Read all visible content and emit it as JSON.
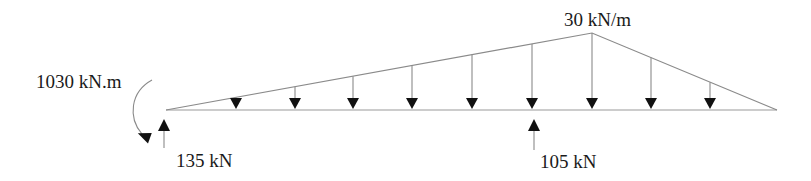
{
  "diagram": {
    "type": "beam-free-body-diagram",
    "load": {
      "label": "30 kN/m",
      "shape": "triangular",
      "peak_value": "30 kN/m",
      "arrow_count": 9
    },
    "moment": {
      "label": "1030 kN.m",
      "direction": "clockwise"
    },
    "reactions": [
      {
        "label": "135 kN",
        "direction": "up",
        "position": "left-end"
      },
      {
        "label": "105 kN",
        "direction": "up",
        "position": "interior"
      }
    ],
    "colors": {
      "line": "#8a8a8a",
      "arrowhead": "#111111",
      "text": "#1a1a1a"
    }
  }
}
